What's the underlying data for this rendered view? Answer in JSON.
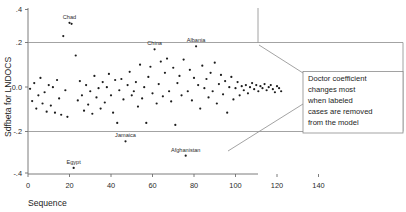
{
  "chart_data": {
    "type": "scatter",
    "title": "",
    "xlabel": "Sequence",
    "ylabel": "Sdfbeta for LNDOCS",
    "xlim": [
      0,
      140
    ],
    "ylim": [
      -0.4,
      0.4
    ],
    "xticks": [
      0,
      20,
      40,
      60,
      80,
      100,
      120,
      140
    ],
    "xticklabels": [
      "0",
      "20",
      "40",
      "60",
      "80",
      "100",
      "120",
      "140"
    ],
    "yticks": [
      0.4,
      0.2,
      0.0,
      -0.2,
      -0.4
    ],
    "yticklabels": [
      ".4",
      ".2",
      "0.0",
      "-.2",
      "-.4"
    ],
    "grid": false,
    "reference_lines": [
      0.2,
      -0.2
    ],
    "legend": "none",
    "marker": "filled-circle",
    "marker_color": "#1c1c1c",
    "points": [
      {
        "x": 1,
        "y": 0.012
      },
      {
        "x": 2,
        "y": -0.048
      },
      {
        "x": 3,
        "y": 0.04
      },
      {
        "x": 4,
        "y": -0.085
      },
      {
        "x": 5,
        "y": -0.02
      },
      {
        "x": 6,
        "y": 0.065
      },
      {
        "x": 7,
        "y": -0.06
      },
      {
        "x": 8,
        "y": -0.005
      },
      {
        "x": 9,
        "y": -0.1
      },
      {
        "x": 10,
        "y": 0.03
      },
      {
        "x": 11,
        "y": -0.07
      },
      {
        "x": 12,
        "y": 0.02
      },
      {
        "x": 13,
        "y": -0.105
      },
      {
        "x": 14,
        "y": 0.055
      },
      {
        "x": 15,
        "y": -0.035
      },
      {
        "x": 16,
        "y": -0.115
      },
      {
        "x": 17,
        "y": 0.27
      },
      {
        "x": 18,
        "y": 0.005
      },
      {
        "x": 19,
        "y": -0.125
      },
      {
        "x": 20,
        "y": 0.335
      },
      {
        "x": 21,
        "y": 0.33
      },
      {
        "x": 22,
        "y": -0.375
      },
      {
        "x": 23,
        "y": 0.175
      },
      {
        "x": 24,
        "y": -0.045
      },
      {
        "x": 25,
        "y": 0.05
      },
      {
        "x": 26,
        "y": -0.02
      },
      {
        "x": 27,
        "y": -0.095
      },
      {
        "x": 28,
        "y": 0.03
      },
      {
        "x": 29,
        "y": -0.065
      },
      {
        "x": 30,
        "y": 0.0
      },
      {
        "x": 31,
        "y": -0.11
      },
      {
        "x": 32,
        "y": 0.075
      },
      {
        "x": 33,
        "y": -0.03
      },
      {
        "x": 34,
        "y": 0.015
      },
      {
        "x": 35,
        "y": -0.085
      },
      {
        "x": 36,
        "y": 0.045
      },
      {
        "x": 37,
        "y": -0.055
      },
      {
        "x": 38,
        "y": 0.02
      },
      {
        "x": 39,
        "y": 0.085
      },
      {
        "x": 40,
        "y": -0.02
      },
      {
        "x": 41,
        "y": -0.105
      },
      {
        "x": 42,
        "y": 0.055
      },
      {
        "x": 43,
        "y": -0.155
      },
      {
        "x": 44,
        "y": 0.005
      },
      {
        "x": 45,
        "y": 0.06
      },
      {
        "x": 46,
        "y": -0.04
      },
      {
        "x": 47,
        "y": -0.245
      },
      {
        "x": 48,
        "y": 0.03
      },
      {
        "x": 49,
        "y": 0.095
      },
      {
        "x": 50,
        "y": -0.02
      },
      {
        "x": 51,
        "y": 0.0
      },
      {
        "x": 52,
        "y": 0.045
      },
      {
        "x": 53,
        "y": -0.075
      },
      {
        "x": 54,
        "y": 0.13
      },
      {
        "x": 55,
        "y": -0.035
      },
      {
        "x": 56,
        "y": 0.02
      },
      {
        "x": 57,
        "y": -0.155
      },
      {
        "x": 58,
        "y": 0.07
      },
      {
        "x": 59,
        "y": 0.12
      },
      {
        "x": 60,
        "y": -0.01
      },
      {
        "x": 61,
        "y": 0.205
      },
      {
        "x": 62,
        "y": -0.06
      },
      {
        "x": 63,
        "y": 0.035
      },
      {
        "x": 64,
        "y": 0.145
      },
      {
        "x": 65,
        "y": -0.025
      },
      {
        "x": 66,
        "y": 0.09
      },
      {
        "x": 67,
        "y": 0.16
      },
      {
        "x": 68,
        "y": 0.0
      },
      {
        "x": 69,
        "y": -0.05
      },
      {
        "x": 70,
        "y": 0.115
      },
      {
        "x": 71,
        "y": -0.165
      },
      {
        "x": 72,
        "y": 0.04
      },
      {
        "x": 73,
        "y": 0.075
      },
      {
        "x": 74,
        "y": -0.02
      },
      {
        "x": 75,
        "y": 0.155
      },
      {
        "x": 76,
        "y": -0.315
      },
      {
        "x": 77,
        "y": 0.0
      },
      {
        "x": 78,
        "y": 0.105
      },
      {
        "x": 79,
        "y": -0.045
      },
      {
        "x": 80,
        "y": 0.065
      },
      {
        "x": 81,
        "y": 0.22
      },
      {
        "x": 82,
        "y": 0.03
      },
      {
        "x": 83,
        "y": -0.085
      },
      {
        "x": 84,
        "y": 0.125
      },
      {
        "x": 85,
        "y": 0.015
      },
      {
        "x": 86,
        "y": 0.06
      },
      {
        "x": 87,
        "y": -0.03
      },
      {
        "x": 88,
        "y": 0.09
      },
      {
        "x": 89,
        "y": 0.0
      },
      {
        "x": 90,
        "y": 0.14
      },
      {
        "x": 91,
        "y": -0.06
      },
      {
        "x": 92,
        "y": 0.035
      },
      {
        "x": 93,
        "y": 0.08
      },
      {
        "x": 94,
        "y": -0.015
      },
      {
        "x": 95,
        "y": 0.05
      },
      {
        "x": 96,
        "y": -0.105
      },
      {
        "x": 97,
        "y": 0.02
      },
      {
        "x": 98,
        "y": 0.07
      },
      {
        "x": 99,
        "y": -0.04
      },
      {
        "x": 100,
        "y": 0.015
      },
      {
        "x": 101,
        "y": 0.045
      },
      {
        "x": 102,
        "y": -0.02
      },
      {
        "x": 103,
        "y": 0.025
      },
      {
        "x": 104,
        "y": 0.005
      },
      {
        "x": 105,
        "y": 0.03
      },
      {
        "x": 106,
        "y": -0.01
      },
      {
        "x": 107,
        "y": 0.02
      },
      {
        "x": 108,
        "y": 0.04
      },
      {
        "x": 109,
        "y": 0.01
      },
      {
        "x": 110,
        "y": 0.03
      },
      {
        "x": 111,
        "y": 0.0
      },
      {
        "x": 112,
        "y": 0.025
      },
      {
        "x": 113,
        "y": 0.015
      },
      {
        "x": 114,
        "y": 0.035
      },
      {
        "x": 115,
        "y": 0.005
      },
      {
        "x": 116,
        "y": 0.02
      },
      {
        "x": 117,
        "y": 0.03
      },
      {
        "x": 118,
        "y": 0.01
      },
      {
        "x": 119,
        "y": -0.005
      },
      {
        "x": 120,
        "y": 0.025
      },
      {
        "x": 121,
        "y": 0.015
      },
      {
        "x": 122,
        "y": 0.0
      }
    ],
    "annotations": [
      {
        "label": "Chad",
        "x": 20,
        "y": 0.335
      },
      {
        "label": "China",
        "x": 61,
        "y": 0.205
      },
      {
        "label": "Albania",
        "x": 81,
        "y": 0.22
      },
      {
        "label": "Jamaica",
        "x": 47,
        "y": -0.245
      },
      {
        "label": "Afghanistan",
        "x": 76,
        "y": -0.315
      },
      {
        "label": "Egypt",
        "x": 22,
        "y": -0.375
      }
    ]
  },
  "callout": {
    "lines": [
      "Doctor coefficient",
      "changes most",
      "when labeled",
      "cases are removed",
      "from the model"
    ]
  }
}
